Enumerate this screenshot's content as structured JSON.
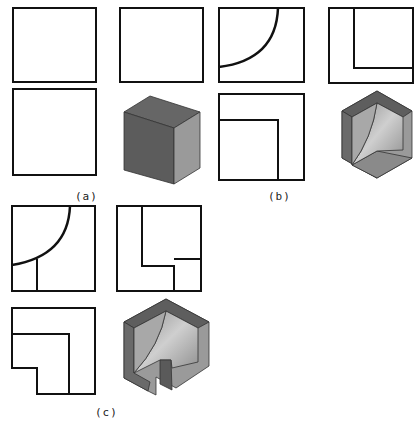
{
  "figures": [
    {
      "id": "a",
      "caption": "(a)",
      "views": [
        "front-view-square",
        "side-view-square",
        "top-view-square",
        "isometric-cube"
      ]
    },
    {
      "id": "b",
      "caption": "(b)",
      "views": [
        "front-view-quarter-arc",
        "side-view-l-notch",
        "top-view-l-notch",
        "isometric-cube-concave-corner"
      ]
    },
    {
      "id": "c",
      "caption": "(c)",
      "views": [
        "front-view-arc-with-slot",
        "side-view-stepped-notch",
        "top-view-stepped-l",
        "isometric-cube-concave-corner-with-slot"
      ]
    }
  ],
  "colors": {
    "line": "#111111",
    "dark_face": "#5e5e5e",
    "mid_face": "#8a8a8a",
    "light_face": "#b8b8b8"
  }
}
